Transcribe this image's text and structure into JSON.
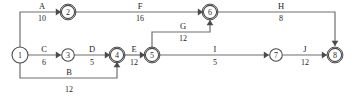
{
  "diagram": {
    "type": "activity-on-arrow-network",
    "nodes": [
      {
        "id": "1",
        "label": "1",
        "cx": 20,
        "cy": 55,
        "r": 8.0,
        "double": false
      },
      {
        "id": "2",
        "label": "2",
        "cx": 68,
        "cy": 12,
        "r": 6.6,
        "double": true
      },
      {
        "id": "3",
        "label": "3",
        "cx": 68,
        "cy": 55,
        "r": 6.3,
        "double": false
      },
      {
        "id": "4",
        "label": "4",
        "cx": 117,
        "cy": 55,
        "r": 6.6,
        "double": true
      },
      {
        "id": "5",
        "label": "5",
        "cx": 152,
        "cy": 55,
        "r": 6.6,
        "double": true
      },
      {
        "id": "6",
        "label": "6",
        "cx": 210,
        "cy": 12,
        "r": 6.6,
        "double": true
      },
      {
        "id": "7",
        "label": "7",
        "cx": 276,
        "cy": 55,
        "r": 6.3,
        "double": false
      },
      {
        "id": "8",
        "label": "8",
        "cx": 335,
        "cy": 55,
        "r": 6.6,
        "double": true
      }
    ],
    "activities": [
      {
        "id": "A",
        "name": "A",
        "duration": "10",
        "from": "1",
        "to": "2",
        "path": "M 20 47 L 20 12 L 61 12",
        "arrow": {
          "x": 61,
          "y": 12,
          "dir": "right"
        },
        "name_x": 42,
        "name_y": 9,
        "dur_x": 42,
        "dur_y": 21
      },
      {
        "id": "B",
        "name": "B",
        "duration": "12",
        "from": "1",
        "to": "4",
        "path": "M 20 63 L 20 78 L 117 78 L 117 62",
        "arrow": {
          "x": 117,
          "y": 62,
          "dir": "up"
        },
        "name_x": 69,
        "name_y": 75,
        "dur_x": 69,
        "dur_y": 92
      },
      {
        "id": "C",
        "name": "C",
        "duration": "6",
        "from": "1",
        "to": "3",
        "path": "M 28 55 L 61 55",
        "arrow": {
          "x": 61,
          "y": 55,
          "dir": "right"
        },
        "name_x": 44,
        "name_y": 52,
        "dur_x": 44,
        "dur_y": 65
      },
      {
        "id": "D",
        "name": "D",
        "duration": "5",
        "from": "3",
        "to": "4",
        "path": "M 74 55 L 110 55",
        "arrow": {
          "x": 110,
          "y": 55,
          "dir": "right"
        },
        "name_x": 92,
        "name_y": 52,
        "dur_x": 92,
        "dur_y": 65
      },
      {
        "id": "E",
        "name": "E",
        "duration": "12",
        "from": "4",
        "to": "5",
        "path": "M 124 55 L 145 55",
        "arrow": {
          "x": 145,
          "y": 55,
          "dir": "right"
        },
        "name_x": 134,
        "name_y": 52,
        "dur_x": 134,
        "dur_y": 65
      },
      {
        "id": "F",
        "name": "F",
        "duration": "16",
        "from": "2",
        "to": "6",
        "path": "M 75 12 L 203 12",
        "arrow": {
          "x": 203,
          "y": 12,
          "dir": "right"
        },
        "name_x": 140,
        "name_y": 9,
        "dur_x": 140,
        "dur_y": 21
      },
      {
        "id": "G",
        "name": "G",
        "duration": "12",
        "from": "5",
        "to": "6",
        "path": "M 152 48 L 152 32 L 210 32 L 210 20",
        "arrow": {
          "x": 210,
          "y": 20,
          "dir": "up"
        },
        "name_x": 183,
        "name_y": 29,
        "dur_x": 183,
        "dur_y": 41
      },
      {
        "id": "H",
        "name": "H",
        "duration": "8",
        "from": "6",
        "to": "8",
        "path": "M 217 12 L 335 12 L 335 46",
        "arrow": {
          "x": 335,
          "y": 46,
          "dir": "down"
        },
        "name_x": 281,
        "name_y": 9,
        "dur_x": 281,
        "dur_y": 21
      },
      {
        "id": "I",
        "name": "I",
        "duration": "5",
        "from": "5",
        "to": "7",
        "path": "M 159 55 L 269 55",
        "arrow": {
          "x": 269,
          "y": 55,
          "dir": "right"
        },
        "name_x": 215,
        "name_y": 52,
        "dur_x": 215,
        "dur_y": 65
      },
      {
        "id": "J",
        "name": "J",
        "duration": "12",
        "from": "7",
        "to": "8",
        "path": "M 283 55 L 327 55",
        "arrow": {
          "x": 327,
          "y": 55,
          "dir": "right"
        },
        "name_x": 305,
        "name_y": 52,
        "dur_x": 305,
        "dur_y": 65
      }
    ],
    "colors": {
      "line": "#6f6f6f",
      "node_stroke": "#4a4a4a",
      "text": "#1e1e1e",
      "background": "#ffffff"
    }
  }
}
